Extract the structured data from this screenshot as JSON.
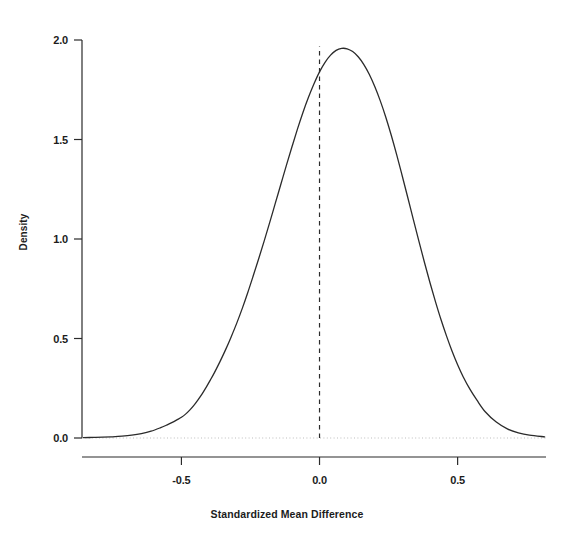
{
  "chart_data": {
    "type": "line",
    "title": "",
    "subtitle": "",
    "xlabel": "Standardized Mean Difference",
    "ylabel": "Density",
    "xlim": [
      -0.86,
      0.82
    ],
    "ylim": [
      -0.09,
      2.06
    ],
    "xticks": [
      -0.5,
      0.0,
      0.5
    ],
    "xtick_labels": [
      "-0.5",
      "0.0",
      "0.5"
    ],
    "yticks": [
      0.0,
      0.5,
      1.0,
      1.5,
      2.0
    ],
    "ytick_labels": [
      "0.0",
      "0.5",
      "1.0",
      "1.5",
      "2.0"
    ],
    "grid": false,
    "legend": "none",
    "line_color": "#2b2b2b",
    "line_width": 1.3,
    "annotations": [
      {
        "name": "zero-reference-line",
        "type": "vline",
        "x": 0.0,
        "style": "dashed",
        "color": "#2b2b2b"
      },
      {
        "name": "zero-density-baseline",
        "type": "hline",
        "y": 0.0,
        "style": "dotted",
        "color": "#b4b4b4"
      }
    ],
    "series": [
      {
        "name": "Kernel density of standardized mean difference",
        "x": [
          -0.855,
          -0.82,
          -0.785,
          -0.75,
          -0.715,
          -0.68,
          -0.645,
          -0.61,
          -0.575,
          -0.555,
          -0.535,
          -0.515,
          -0.5,
          -0.485,
          -0.47,
          -0.455,
          -0.44,
          -0.425,
          -0.41,
          -0.395,
          -0.38,
          -0.36,
          -0.34,
          -0.32,
          -0.3,
          -0.28,
          -0.26,
          -0.24,
          -0.22,
          -0.2,
          -0.18,
          -0.16,
          -0.14,
          -0.12,
          -0.1,
          -0.08,
          -0.06,
          -0.04,
          -0.02,
          0.0,
          0.02,
          0.04,
          0.06,
          0.08,
          0.1,
          0.12,
          0.14,
          0.16,
          0.18,
          0.2,
          0.22,
          0.24,
          0.26,
          0.28,
          0.3,
          0.32,
          0.34,
          0.36,
          0.38,
          0.4,
          0.42,
          0.44,
          0.46,
          0.48,
          0.5,
          0.52,
          0.545,
          0.57,
          0.6,
          0.64,
          0.68,
          0.72,
          0.76,
          0.815
        ],
        "y": [
          0.002,
          0.003,
          0.004,
          0.006,
          0.009,
          0.014,
          0.022,
          0.034,
          0.052,
          0.064,
          0.077,
          0.092,
          0.104,
          0.12,
          0.14,
          0.164,
          0.192,
          0.222,
          0.256,
          0.292,
          0.33,
          0.385,
          0.444,
          0.508,
          0.576,
          0.65,
          0.73,
          0.815,
          0.902,
          0.992,
          1.085,
          1.18,
          1.275,
          1.37,
          1.462,
          1.552,
          1.636,
          1.712,
          1.78,
          1.84,
          1.888,
          1.924,
          1.948,
          1.958,
          1.956,
          1.942,
          1.916,
          1.878,
          1.828,
          1.766,
          1.694,
          1.612,
          1.52,
          1.42,
          1.314,
          1.206,
          1.096,
          0.988,
          0.882,
          0.78,
          0.684,
          0.594,
          0.512,
          0.436,
          0.368,
          0.308,
          0.244,
          0.19,
          0.132,
          0.08,
          0.046,
          0.026,
          0.014,
          0.006
        ],
        "peak_x": 0.07,
        "peak_y": 1.96
      }
    ]
  },
  "axes": {
    "x_title": "Standardized Mean Difference",
    "y_title": "Density"
  }
}
